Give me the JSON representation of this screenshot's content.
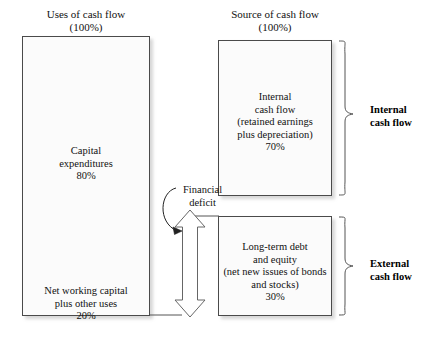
{
  "figure": {
    "type": "flow-diagram",
    "title_left": "Uses of cash flow\n(100%)",
    "title_right": "Source of cash flow\n(100%)"
  },
  "uses": {
    "header": "Uses of cash flow\n(100%)",
    "items": [
      {
        "label": "Capital\nexpenditures\n80%",
        "percent": 80
      },
      {
        "label": "Net working capital\nplus other uses\n20%",
        "percent": 20
      }
    ]
  },
  "sources": {
    "header": "Source of cash flow\n(100%)",
    "items": [
      {
        "label": "Internal\ncash flow\n(retained earnings\nplus depreciation)\n70%",
        "percent": 70,
        "brace_label": "Internal\ncash flow"
      },
      {
        "label": "Long-term debt\nand equity\n(net new issues of bonds\nand stocks)\n30%",
        "percent": 30,
        "brace_label": "External\ncash flow"
      }
    ]
  },
  "annotations": {
    "financial_deficit": "Financial\ndeficit"
  },
  "colors": {
    "box_fill": "#fbfbfb",
    "box_border": "#4a4a4a",
    "line": "#555555",
    "text": "#111111",
    "shadow": "rgba(140,140,140,0.35)"
  },
  "icons": {
    "double_arrow": "double-headed-vertical-arrow",
    "curved_pointer": "curved-arrow-pointer",
    "brace_top": "curly-brace-right",
    "brace_bottom": "curly-brace-right"
  }
}
